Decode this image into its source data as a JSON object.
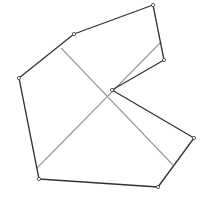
{
  "diagram": {
    "type": "polygon-with-diagonals",
    "width": 205,
    "height": 198,
    "background": "#ffffff",
    "polygon": {
      "stroke": "#333333",
      "stroke_width": 1.3,
      "vertex_marker_radius": 1.6,
      "vertices": [
        [
          74,
          34
        ],
        [
          153,
          5
        ],
        [
          164,
          60
        ],
        [
          112,
          90
        ],
        [
          194,
          138
        ],
        [
          158,
          187
        ],
        [
          39,
          179
        ],
        [
          19,
          78
        ]
      ]
    },
    "diagonals": {
      "stroke": "#999999",
      "stroke_width": 1.1,
      "lines": [
        {
          "from": [
            61,
            48
          ],
          "to": [
            173,
            165
          ]
        },
        {
          "from": [
            161,
            42
          ],
          "to": [
            37,
            168
          ]
        }
      ]
    }
  }
}
